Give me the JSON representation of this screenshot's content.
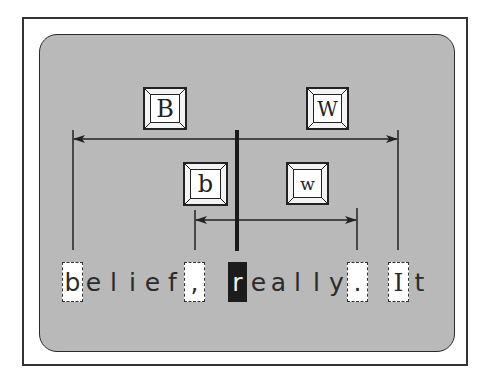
{
  "diagram": {
    "colors": {
      "frame": "#333333",
      "panel_bg": "#b9b9b9",
      "cursor_bg": "#1c1c1c",
      "mark_bg": "#ffffff",
      "line": "#222222"
    },
    "keys": [
      {
        "id": "B",
        "label": "B",
        "description": "back one WORD"
      },
      {
        "id": "W",
        "label": "W",
        "description": "forward one WORD"
      },
      {
        "id": "b",
        "label": "b",
        "description": "back one word"
      },
      {
        "id": "w",
        "label": "w",
        "description": "forward one word"
      }
    ],
    "text_line": {
      "chars": [
        "b",
        "e",
        "l",
        "i",
        "e",
        "f",
        ",",
        "r",
        "e",
        "a",
        "l",
        "l",
        "y",
        ".",
        "I",
        "t"
      ],
      "cursor_index": 7,
      "cursor_char": "r",
      "marked_chars": [
        {
          "char": "b",
          "target_of": "B"
        },
        {
          "char": ",",
          "target_of": "b"
        },
        {
          "char": ".",
          "target_of": "w"
        },
        {
          "char": "I",
          "target_of": "W"
        }
      ]
    }
  }
}
